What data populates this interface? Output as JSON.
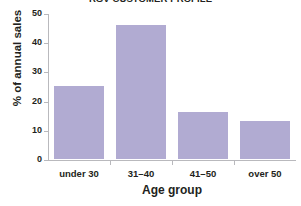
{
  "chart_data": {
    "type": "bar",
    "title": "RGV CUSTOMER PROFILE",
    "xlabel": "Age group",
    "ylabel": "% of annual sales",
    "categories": [
      "under 30",
      "31–40",
      "41–50",
      "over 50"
    ],
    "values": [
      25,
      46,
      16,
      13
    ],
    "ylim": [
      0,
      50
    ],
    "yticks": [
      0,
      10,
      20,
      30,
      40,
      50
    ],
    "ytick_labels": [
      "0",
      "10",
      "20",
      "30",
      "40",
      "50"
    ],
    "grid": false,
    "legend": null,
    "bar_color": "#b1abd2",
    "axis_color": "#b9b9bd",
    "text_color": "#231f20",
    "background": "#ffffff"
  }
}
